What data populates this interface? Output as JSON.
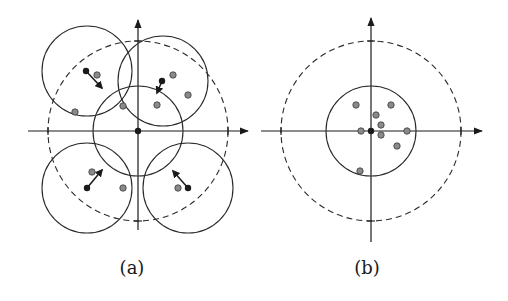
{
  "panels": [
    {
      "id": "a",
      "label": "(a)",
      "origin": [
        138,
        131
      ],
      "outer_dashed_radius": 90,
      "small_circle_radius": 45,
      "small_circles": [
        {
          "center": [
            138,
            131
          ]
        },
        {
          "center": [
            87,
            71
          ]
        },
        {
          "center": [
            163,
            81
          ]
        },
        {
          "center": [
            87,
            188
          ]
        },
        {
          "center": [
            188,
            188
          ]
        }
      ],
      "black_points": [
        [
          138,
          131
        ],
        [
          86,
          71
        ],
        [
          162,
          81
        ],
        [
          87,
          188
        ],
        [
          188,
          188
        ]
      ],
      "gray_points": [
        [
          97,
          75
        ],
        [
          75,
          112
        ],
        [
          123,
          106
        ],
        [
          173,
          75
        ],
        [
          188,
          95
        ],
        [
          157,
          105
        ],
        [
          92,
          172
        ],
        [
          123,
          188
        ],
        [
          178,
          188
        ]
      ],
      "arrows": [
        {
          "from": [
            86,
            71
          ],
          "to": [
            102,
            88
          ]
        },
        {
          "from": [
            162,
            81
          ],
          "to": [
            157,
            93
          ]
        },
        {
          "from": [
            87,
            188
          ],
          "to": [
            102,
            170
          ]
        },
        {
          "from": [
            188,
            188
          ],
          "to": [
            173,
            171
          ]
        }
      ]
    },
    {
      "id": "b",
      "label": "(b)",
      "origin": [
        371,
        131
      ],
      "outer_dashed_radius": 90,
      "small_circle_radius": 45,
      "small_circles": [
        {
          "center": [
            371,
            131
          ]
        }
      ],
      "black_points": [
        [
          371,
          131
        ]
      ],
      "gray_points": [
        [
          356,
          105
        ],
        [
          391,
          105
        ],
        [
          376,
          115
        ],
        [
          381,
          125
        ],
        [
          361,
          131
        ],
        [
          407,
          131
        ],
        [
          381,
          135
        ],
        [
          397,
          146
        ],
        [
          360,
          171
        ]
      ],
      "arrows": []
    }
  ]
}
